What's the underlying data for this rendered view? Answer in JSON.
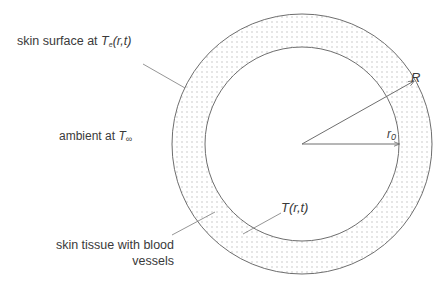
{
  "diagram": {
    "title": "",
    "labels": {
      "surface_prefix": "skin surface at ",
      "surface_var": "T",
      "surface_sub": "e",
      "surface_args": "(r,t)",
      "ambient_prefix": "ambient at ",
      "ambient_var": "T",
      "ambient_sub": "∞",
      "tissue_line1": "skin tissue with blood",
      "tissue_line2": "vessels",
      "outer_radius": "R",
      "inner_radius_var": "r",
      "inner_radius_sub": "0",
      "tissue_temp": "T(r,t)"
    },
    "geometry": {
      "center": [
        302,
        144
      ],
      "outer_radius": 130,
      "inner_radius": 97,
      "R_arrow_end": [
        414,
        81
      ],
      "r0_arrow_end": [
        399,
        144
      ]
    },
    "colors": {
      "stroke": "#6e6e6e",
      "dots": "#9a9a9a",
      "text": "#3a3a3a"
    }
  }
}
